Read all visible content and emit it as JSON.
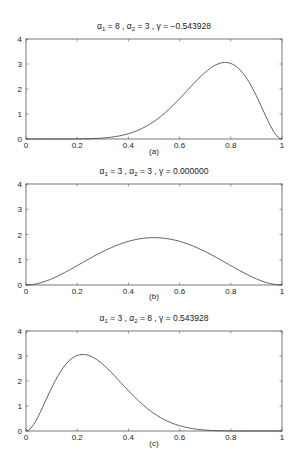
{
  "chart_data": [
    {
      "type": "line",
      "panel_label": "(a)",
      "title": "α1 = 8 , α2 = 3 , γ = −0.543928",
      "title_parts": {
        "a1": "8",
        "a2": "3",
        "gamma": "−0.543928"
      },
      "alpha1": 8,
      "alpha2": 3,
      "xlabel": "(a)",
      "ylabel": "",
      "xlim": [
        0,
        1
      ],
      "ylim": [
        0,
        4
      ],
      "xticks": [
        "0",
        "0.2",
        "0.4",
        "0.6",
        "0.8",
        "1"
      ],
      "yticks": [
        "0",
        "1",
        "2",
        "3",
        "4"
      ],
      "x": [
        0,
        0.1,
        0.2,
        0.3,
        0.4,
        0.5,
        0.6,
        0.7,
        0.75,
        0.8,
        0.9,
        1.0
      ],
      "values": [
        0,
        0.0004,
        0.0164,
        0.11,
        0.38,
        0.88,
        1.61,
        2.47,
        2.94,
        3.01,
        1.92,
        0
      ],
      "grid": false
    },
    {
      "type": "line",
      "panel_label": "(b)",
      "title": "α1 = 3 , α2 = 3 , γ = 0.000000",
      "title_parts": {
        "a1": "3",
        "a2": "3",
        "gamma": "0.000000"
      },
      "alpha1": 3,
      "alpha2": 3,
      "xlabel": "(b)",
      "ylabel": "",
      "xlim": [
        0,
        1
      ],
      "ylim": [
        0,
        4
      ],
      "xticks": [
        "0",
        "0.2",
        "0.4",
        "0.6",
        "0.8",
        "1"
      ],
      "yticks": [
        "0",
        "1",
        "2",
        "3",
        "4"
      ],
      "x": [
        0,
        0.1,
        0.2,
        0.3,
        0.4,
        0.5,
        0.6,
        0.7,
        0.8,
        0.9,
        1.0
      ],
      "values": [
        0,
        0.24,
        0.77,
        1.32,
        1.73,
        1.875,
        1.73,
        1.32,
        0.77,
        0.24,
        0
      ],
      "grid": false
    },
    {
      "type": "line",
      "panel_label": "(c)",
      "title": "α1 = 3 , α2 = 8 , γ = 0.543928",
      "title_parts": {
        "a1": "3",
        "a2": "8",
        "gamma": "0.543928"
      },
      "alpha1": 3,
      "alpha2": 8,
      "xlabel": "(c)",
      "ylabel": "",
      "xlim": [
        0,
        1
      ],
      "ylim": [
        0,
        4
      ],
      "xticks": [
        "0",
        "0.2",
        "0.4",
        "0.6",
        "0.8",
        "1"
      ],
      "yticks": [
        "0",
        "1",
        "2",
        "3",
        "4"
      ],
      "x": [
        0,
        0.1,
        0.2,
        0.25,
        0.3,
        0.4,
        0.5,
        0.6,
        0.7,
        0.8,
        0.9,
        1.0
      ],
      "values": [
        0,
        1.92,
        3.01,
        2.94,
        2.47,
        1.61,
        0.88,
        0.38,
        0.11,
        0.0164,
        0.0004,
        0
      ],
      "grid": false
    }
  ]
}
